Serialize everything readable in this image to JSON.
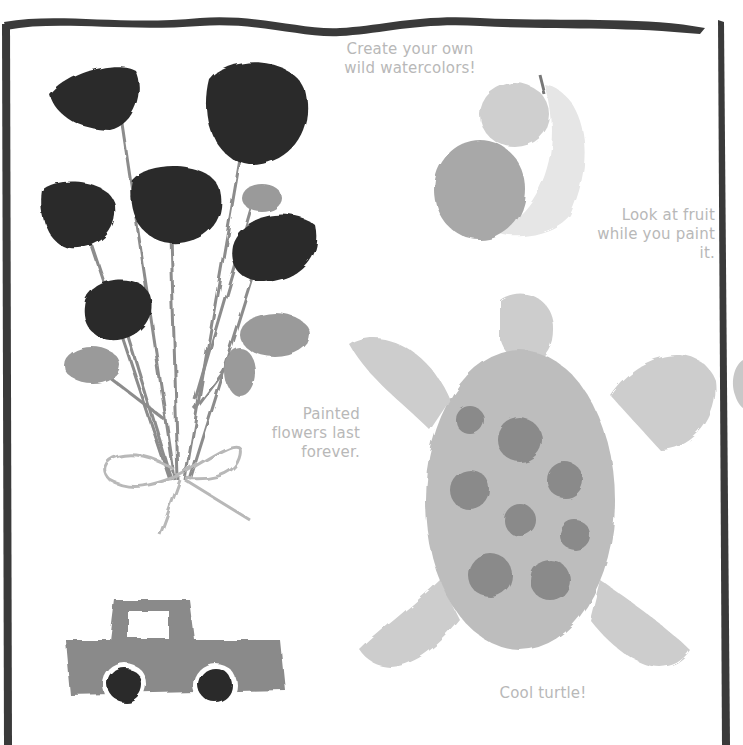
{
  "page": {
    "captions": {
      "create": "Create your own wild watercolors!",
      "fruit": "Look at fruit while you paint it.",
      "flowers": "Painted flowers last forever.",
      "turtle": "Cool turtle!"
    },
    "illustrations": [
      "flower-bouquet",
      "fruit-apples-banana",
      "sea-turtle",
      "pickup-truck"
    ],
    "colors": {
      "border": "#3a3a3a",
      "flower": "#2a2a2a",
      "caption": "#b8b8b8"
    }
  }
}
